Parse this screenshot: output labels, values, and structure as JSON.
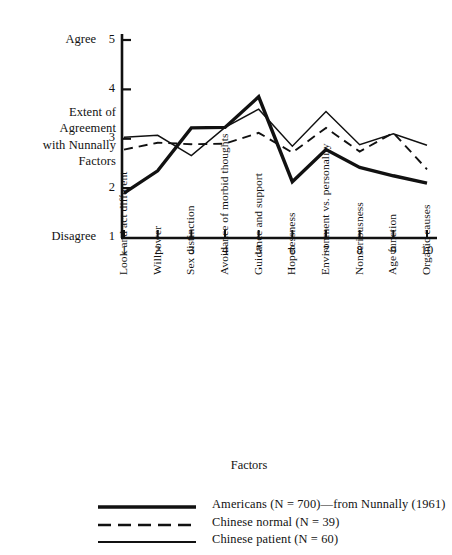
{
  "chart_data": {
    "type": "line",
    "title": "",
    "xlabel": "Factors",
    "ylabel": "Extent of Agreement with Nunnally Factors",
    "ylim": [
      1,
      5
    ],
    "yticks": [
      1,
      2,
      3,
      4,
      5
    ],
    "ytick_labels": [
      "1",
      "2",
      "3",
      "4",
      "5"
    ],
    "y_axis_low_label": "Disagree",
    "y_axis_high_label": "Agree",
    "grid": false,
    "legend_position": "bottom",
    "x": [
      1,
      2,
      3,
      4,
      5,
      6,
      7,
      8,
      9,
      10
    ],
    "xtick_labels": [
      "1",
      "2",
      "3",
      "4",
      "5",
      "6",
      "7",
      "8",
      "9",
      "10"
    ],
    "categories": [
      "Look and act different",
      "Willpower",
      "Sex distinction",
      "Avoidance of morbid thoughts",
      "Guidance and support",
      "Hopelessness",
      "Environment vs. personality",
      "Nonseriousness",
      "Age function",
      "Organic causes"
    ],
    "series": [
      {
        "name": "Americans (N = 700)—from Nunnally (1961)",
        "style": "thick-solid",
        "color": "#111111",
        "values": [
          1.9,
          2.35,
          3.22,
          3.23,
          3.85,
          2.13,
          2.78,
          2.42,
          2.25,
          2.1
        ]
      },
      {
        "name": "Chinese normal (N = 39)",
        "style": "dashed",
        "color": "#111111",
        "values": [
          2.78,
          2.92,
          2.89,
          2.9,
          3.12,
          2.72,
          3.22,
          2.74,
          3.12,
          2.38
        ]
      },
      {
        "name": "Chinese patient (N = 60)",
        "style": "thin-solid",
        "color": "#111111",
        "values": [
          3.03,
          3.07,
          2.66,
          3.23,
          3.6,
          2.85,
          3.55,
          2.88,
          3.1,
          2.87
        ]
      }
    ]
  },
  "ylabel_lines": [
    "Extent of",
    "Agreement",
    "with Nunnally",
    "Factors"
  ],
  "legend": [
    {
      "key": "thick-solid",
      "label": "Americans (N = 700)—from Nunnally (1961)"
    },
    {
      "key": "dashed",
      "label": "Chinese normal (N = 39)"
    },
    {
      "key": "thin-solid",
      "label": "Chinese patient (N = 60)"
    }
  ]
}
